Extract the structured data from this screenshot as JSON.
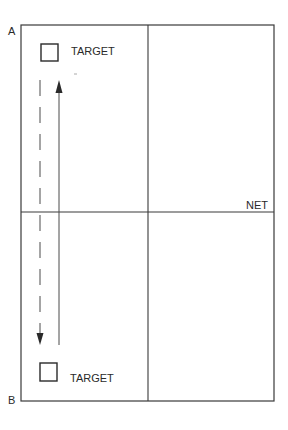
{
  "diagram": {
    "corner_labels": {
      "top_left": "A",
      "bottom_left": "B"
    },
    "net_label": "NET",
    "targets": [
      {
        "label": "TARGET",
        "position": "top"
      },
      {
        "label": "TARGET",
        "position": "bottom"
      }
    ],
    "paths": [
      {
        "style": "dashed",
        "direction": "down",
        "from": "top target",
        "to": "bottom target"
      },
      {
        "style": "solid",
        "direction": "up",
        "from": "bottom target",
        "to": "top target"
      }
    ],
    "colors": {
      "line": "#3a3a3a",
      "background": "#ffffff"
    }
  }
}
